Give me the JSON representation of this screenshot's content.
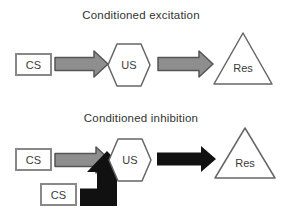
{
  "colors": {
    "background": "#ffffff",
    "arrow_gray": "#8e8e8e",
    "arrow_gray_outline": "#555555",
    "arrow_black": "#111111",
    "shape_fill": "#ffffff",
    "shape_outline": "#666666",
    "box_border": "#888888",
    "text": "#3a3a3a"
  },
  "excitation": {
    "title": "Conditioned excitation",
    "cs_label": "CS",
    "us_label": "US",
    "res_label": "Res"
  },
  "inhibition": {
    "title": "Conditioned inhibition",
    "cs1_label": "CS",
    "cs2_label": "CS",
    "us_label": "US",
    "res_label": "Res"
  }
}
